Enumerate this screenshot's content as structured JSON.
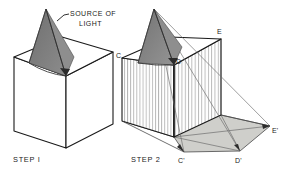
{
  "figure": {
    "title_visible": false,
    "background_color": "#ffffff",
    "ink_color": "#1a1a1a",
    "cone_fill": "#7d7d7d",
    "cone_fill_light": "#8d8d8d",
    "shadow_fill": "#cfcfcb",
    "hatch_color": "#9a9a9a",
    "type": "technical-illustration"
  },
  "annotations": {
    "source_of_light_line1": "SOURCE OF",
    "source_of_light_line2": "LIGHT",
    "step1_label": "STEP I",
    "step2_label": "STEP 2"
  },
  "points": {
    "c": "C",
    "d": "D",
    "e": "E",
    "c_prime": "C'",
    "d_prime": "D'",
    "e_prime": "E'"
  },
  "left_figure": {
    "name": "STEP I",
    "cube": {
      "top_front": [
        66,
        76
      ],
      "top_left": [
        14,
        57
      ],
      "top_back": [
        62,
        37
      ],
      "top_right": [
        113,
        52
      ],
      "bottom_front": [
        66,
        148
      ],
      "bottom_left": [
        14,
        131
      ],
      "bottom_right": [
        113,
        124
      ]
    },
    "light_apex": [
      46,
      9
    ],
    "cone_base_left": [
      30,
      62
    ],
    "cone_base_right": [
      66,
      76
    ]
  },
  "right_figure": {
    "name": "STEP 2",
    "cube": {
      "top_front": [
        174,
        65
      ],
      "top_left": [
        122,
        58
      ],
      "top_back": [
        170,
        37
      ],
      "top_right": [
        221,
        39
      ],
      "bottom_front": [
        174,
        137
      ],
      "bottom_left": [
        122,
        121
      ],
      "bottom_right": [
        221,
        115
      ]
    },
    "light_apex": [
      154,
      9
    ],
    "ground": {
      "c_prime": [
        184,
        152
      ],
      "d_prime": [
        240,
        151
      ],
      "e_prime": [
        270,
        126
      ]
    }
  }
}
